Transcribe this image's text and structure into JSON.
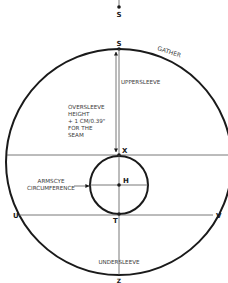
{
  "diagram": {
    "colors": {
      "stroke": "#1a1a1a",
      "thin_line": "#555555",
      "label": "#3a3a3a",
      "background": "#ffffff"
    },
    "points": {
      "s_top": "S",
      "s": "S",
      "x": "X",
      "h": "H",
      "t": "T",
      "u": "U",
      "v": "V",
      "z": "Z"
    },
    "labels": {
      "gather": "GATHER",
      "uppersleeve": "UPPERSLEEVE",
      "oversleeve_height": [
        "OVERSLEEVE",
        "HEIGHT",
        "+ 1 CM/0.39\"",
        "FOR THE",
        "SEAM"
      ],
      "armscye_circumference": [
        "ARMSCYE",
        "CIRCUMFERENCE"
      ],
      "undersleeve": "UNDERSLEEVE"
    }
  }
}
